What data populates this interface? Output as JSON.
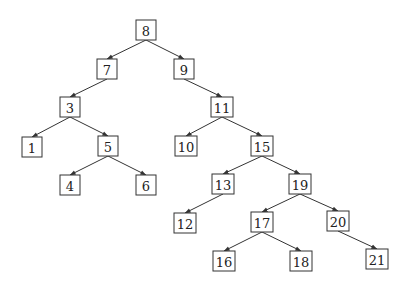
{
  "diagram": {
    "type": "binary-search-tree",
    "colors": {
      "stroke": "#333333",
      "text": "#222222",
      "background": "#ffffff"
    },
    "nodes": [
      {
        "id": "n8",
        "label": "8",
        "x": 146,
        "y": 30
      },
      {
        "id": "n7",
        "label": "7",
        "x": 107,
        "y": 69
      },
      {
        "id": "n9",
        "label": "9",
        "x": 184,
        "y": 69
      },
      {
        "id": "n3",
        "label": "3",
        "x": 70,
        "y": 107
      },
      {
        "id": "n11",
        "label": "11",
        "x": 222,
        "y": 107
      },
      {
        "id": "n1",
        "label": "1",
        "x": 32,
        "y": 147
      },
      {
        "id": "n5",
        "label": "5",
        "x": 108,
        "y": 146
      },
      {
        "id": "n10",
        "label": "10",
        "x": 186,
        "y": 146
      },
      {
        "id": "n15",
        "label": "15",
        "x": 262,
        "y": 146
      },
      {
        "id": "n4",
        "label": "4",
        "x": 70,
        "y": 185
      },
      {
        "id": "n6",
        "label": "6",
        "x": 146,
        "y": 185
      },
      {
        "id": "n13",
        "label": "13",
        "x": 223,
        "y": 184
      },
      {
        "id": "n19",
        "label": "19",
        "x": 300,
        "y": 184
      },
      {
        "id": "n12",
        "label": "12",
        "x": 185,
        "y": 223
      },
      {
        "id": "n17",
        "label": "17",
        "x": 262,
        "y": 222
      },
      {
        "id": "n20",
        "label": "20",
        "x": 338,
        "y": 221
      },
      {
        "id": "n16",
        "label": "16",
        "x": 224,
        "y": 261
      },
      {
        "id": "n18",
        "label": "18",
        "x": 301,
        "y": 261
      },
      {
        "id": "n21",
        "label": "21",
        "x": 377,
        "y": 259
      }
    ],
    "edges": [
      {
        "from": "n8",
        "to": "n7"
      },
      {
        "from": "n8",
        "to": "n9"
      },
      {
        "from": "n7",
        "to": "n3"
      },
      {
        "from": "n9",
        "to": "n11"
      },
      {
        "from": "n3",
        "to": "n1"
      },
      {
        "from": "n3",
        "to": "n5"
      },
      {
        "from": "n11",
        "to": "n10"
      },
      {
        "from": "n11",
        "to": "n15"
      },
      {
        "from": "n5",
        "to": "n4"
      },
      {
        "from": "n5",
        "to": "n6"
      },
      {
        "from": "n15",
        "to": "n13"
      },
      {
        "from": "n15",
        "to": "n19"
      },
      {
        "from": "n13",
        "to": "n12"
      },
      {
        "from": "n19",
        "to": "n17"
      },
      {
        "from": "n19",
        "to": "n20"
      },
      {
        "from": "n17",
        "to": "n16"
      },
      {
        "from": "n17",
        "to": "n18"
      },
      {
        "from": "n20",
        "to": "n21"
      }
    ]
  }
}
